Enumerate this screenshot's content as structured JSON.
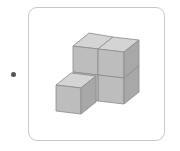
{
  "figure": {
    "type": "isometric cube arrangement",
    "cube_count": 5,
    "colors": {
      "top": "#d4d4d4",
      "front": "#bdbdbd",
      "side": "#a8a8a8",
      "edge": "#8a8a8a",
      "card_border": "#c8c8c8",
      "bullet": "#555555"
    }
  }
}
